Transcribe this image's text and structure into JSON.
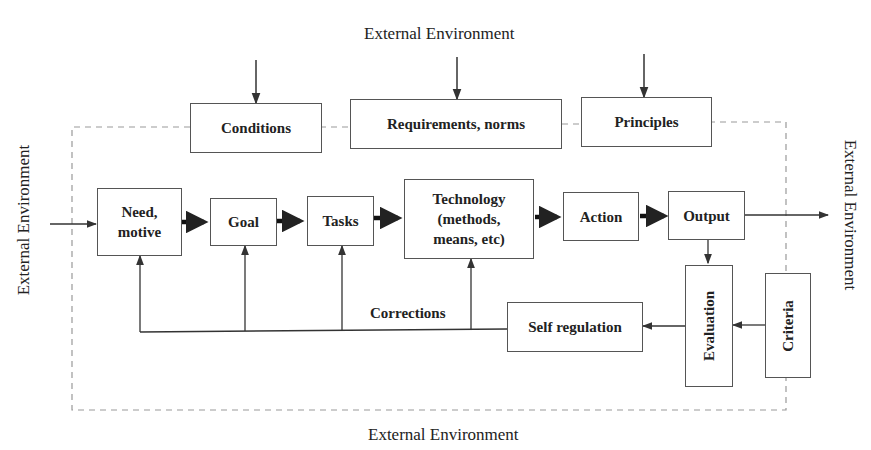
{
  "diagram": {
    "external_environment": {
      "top": "External Environment",
      "bottom": "External Environment",
      "left": "External Environment",
      "right": "External Environment"
    },
    "constraints": {
      "conditions": "Conditions",
      "requirements": "Requirements, norms",
      "principles": "Principles"
    },
    "flow": {
      "need": [
        "Need,",
        "motive"
      ],
      "goal": "Goal",
      "tasks": "Tasks",
      "technology": [
        "Technology",
        "(methods,",
        "means, etc)"
      ],
      "action": "Action",
      "output": "Output"
    },
    "feedback": {
      "evaluation": "Evaluation",
      "criteria": "Criteria",
      "self_regulation": "Self regulation",
      "corrections_label": "Corrections"
    },
    "colors": {
      "line": "#333333",
      "box_border": "#555555",
      "dashed_boundary": "#999999"
    }
  }
}
